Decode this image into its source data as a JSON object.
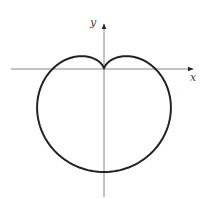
{
  "chart_data": {
    "type": "line",
    "title": "",
    "subtitle": "",
    "xlabel": "x",
    "ylabel": "y",
    "xlim": [
      -1.8,
      1.7
    ],
    "ylim": [
      -2.5,
      0.9
    ],
    "grid": false,
    "legend": null,
    "tick_labels": {
      "x": [],
      "y": []
    },
    "series": [
      {
        "name": "r = 1 - sin(theta)",
        "polar": true,
        "equation": "r = 1 - sin(theta)",
        "key_points": [
          {
            "label": "cusp",
            "x": 0,
            "y": 0
          },
          {
            "label": "bottom",
            "x": 0,
            "y": -2
          },
          {
            "label": "x-intercept-left",
            "x": -1,
            "y": 0
          },
          {
            "label": "x-intercept-right",
            "x": 1,
            "y": 0
          },
          {
            "label": "leftmost",
            "x": -1.299,
            "y": -0.75
          },
          {
            "label": "rightmost",
            "x": 1.299,
            "y": -0.75
          },
          {
            "label": "left-lobe-top",
            "x": -0.433,
            "y": 0.25
          },
          {
            "label": "right-lobe-top",
            "x": 0.433,
            "y": 0.25
          }
        ],
        "color": "#222222"
      }
    ],
    "render": {
      "origin_px": [
        104,
        69
      ],
      "scale_px": 51.5,
      "x_axis_px": [
        11,
        193
      ],
      "y_axis_px": [
        24,
        197
      ],
      "axis_color": "#888888",
      "curve_color": "#222222",
      "curve_width": 2
    }
  },
  "labels": {
    "x_axis": "x",
    "y_axis": "y"
  }
}
